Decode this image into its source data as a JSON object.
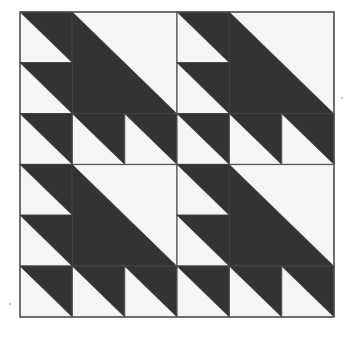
{
  "artwork": {
    "title": "Half-Square Triangle Quilt Block Pattern",
    "description": "Monochrome geometric tiling of half-square triangles arranged in a six-by-six grid with four large quadrant diagonals",
    "type": "geometric-pattern",
    "background_color": "#ffffff",
    "paper_color": "#f4f4f2",
    "light_color": "#f5f5f3",
    "dark_color": "#333333",
    "border_color": "#555555",
    "border_width": 1.2,
    "frame": {
      "x": 20,
      "y": 12,
      "width": 314,
      "height": 305
    },
    "grid": {
      "columns": 6,
      "rows": 6,
      "cell_width": 52.33,
      "cell_height": 50.83
    },
    "tiles": [
      {
        "name": "tile-r0c0",
        "col": 0,
        "row": 0,
        "span": 1,
        "orientation": "dark-upper-right"
      },
      {
        "name": "tile-r0c1-large",
        "col": 1,
        "row": 0,
        "span": 2,
        "orientation": "dark-lower-left"
      },
      {
        "name": "tile-r0c3",
        "col": 3,
        "row": 0,
        "span": 1,
        "orientation": "dark-upper-right"
      },
      {
        "name": "tile-r0c4-large",
        "col": 4,
        "row": 0,
        "span": 2,
        "orientation": "dark-lower-left"
      },
      {
        "name": "tile-r1c0",
        "col": 0,
        "row": 1,
        "span": 1,
        "orientation": "dark-upper-right"
      },
      {
        "name": "tile-r1c3",
        "col": 3,
        "row": 1,
        "span": 1,
        "orientation": "dark-upper-right"
      },
      {
        "name": "tile-r2c0",
        "col": 0,
        "row": 2,
        "span": 1,
        "orientation": "dark-upper-right"
      },
      {
        "name": "tile-r2c1",
        "col": 1,
        "row": 2,
        "span": 1,
        "orientation": "dark-upper-right"
      },
      {
        "name": "tile-r2c2",
        "col": 2,
        "row": 2,
        "span": 1,
        "orientation": "dark-upper-right"
      },
      {
        "name": "tile-r2c3",
        "col": 3,
        "row": 2,
        "span": 1,
        "orientation": "dark-upper-right"
      },
      {
        "name": "tile-r2c4",
        "col": 4,
        "row": 2,
        "span": 1,
        "orientation": "dark-upper-right"
      },
      {
        "name": "tile-r2c5",
        "col": 5,
        "row": 2,
        "span": 1,
        "orientation": "dark-upper-right"
      },
      {
        "name": "tile-r3c0",
        "col": 0,
        "row": 3,
        "span": 1,
        "orientation": "dark-upper-right"
      },
      {
        "name": "tile-r3c1-large",
        "col": 1,
        "row": 3,
        "span": 2,
        "orientation": "dark-lower-left"
      },
      {
        "name": "tile-r3c3",
        "col": 3,
        "row": 3,
        "span": 1,
        "orientation": "dark-upper-right"
      },
      {
        "name": "tile-r3c4-large",
        "col": 4,
        "row": 3,
        "span": 2,
        "orientation": "dark-lower-left"
      },
      {
        "name": "tile-r4c0",
        "col": 0,
        "row": 4,
        "span": 1,
        "orientation": "dark-upper-right"
      },
      {
        "name": "tile-r4c3",
        "col": 3,
        "row": 4,
        "span": 1,
        "orientation": "dark-upper-right"
      },
      {
        "name": "tile-r5c0",
        "col": 0,
        "row": 5,
        "span": 1,
        "orientation": "dark-upper-right"
      },
      {
        "name": "tile-r5c1",
        "col": 1,
        "row": 5,
        "span": 1,
        "orientation": "dark-upper-right"
      },
      {
        "name": "tile-r5c2",
        "col": 2,
        "row": 5,
        "span": 1,
        "orientation": "dark-upper-right"
      },
      {
        "name": "tile-r5c3",
        "col": 3,
        "row": 5,
        "span": 1,
        "orientation": "dark-upper-right"
      },
      {
        "name": "tile-r5c4",
        "col": 4,
        "row": 5,
        "span": 1,
        "orientation": "dark-upper-right"
      },
      {
        "name": "tile-r5c5",
        "col": 5,
        "row": 5,
        "span": 1,
        "orientation": "dark-upper-right"
      }
    ],
    "specks": [
      {
        "name": "speck-right-margin",
        "x": 341,
        "y": 97,
        "width": 2,
        "height": 2
      },
      {
        "name": "speck-lower-left",
        "x": 9,
        "y": 303,
        "width": 2,
        "height": 2
      }
    ]
  }
}
